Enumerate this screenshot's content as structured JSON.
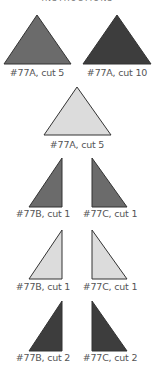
{
  "heading": "INSTRUCTIONS",
  "colors": {
    "medium": "#6b6b6b",
    "dark": "#3d3d3d",
    "light": "#dcdcdc",
    "stroke": "#333333"
  },
  "pieces": [
    {
      "id": "p1",
      "label": "#77A, cut 5",
      "shade": "medium",
      "points": "37,15 4,64 71,64",
      "label_x": 37,
      "label_y": 67
    },
    {
      "id": "p2",
      "label": "#77A, cut 10",
      "shade": "dark",
      "points": "117,15 83,64 151,64",
      "label_x": 117,
      "label_y": 67
    },
    {
      "id": "p3",
      "label": "#77A, cut 5",
      "shade": "light",
      "points": "77,87 44,135 111,135",
      "label_x": 77,
      "label_y": 139
    },
    {
      "id": "p4",
      "label": "#77B, cut 1",
      "shade": "medium",
      "points": "62,158 29,207 62,207",
      "label_x": 43,
      "label_y": 208
    },
    {
      "id": "p5",
      "label": "#77C, cut 1",
      "shade": "medium",
      "points": "92,158 92,207 127,207",
      "label_x": 110,
      "label_y": 208
    },
    {
      "id": "p6",
      "label": "#77B, cut 1",
      "shade": "light",
      "points": "62,230 29,279 62,279",
      "label_x": 43,
      "label_y": 281
    },
    {
      "id": "p7",
      "label": "#77C, cut 1",
      "shade": "light",
      "points": "92,230 92,279 127,279",
      "label_x": 110,
      "label_y": 281
    },
    {
      "id": "p8",
      "label": "#77B, cut 2",
      "shade": "dark",
      "points": "62,301 29,351 62,351",
      "label_x": 43,
      "label_y": 352
    },
    {
      "id": "p9",
      "label": "#77C, cut 2",
      "shade": "dark",
      "points": "92,301 92,351 127,351",
      "label_x": 110,
      "label_y": 352
    }
  ]
}
